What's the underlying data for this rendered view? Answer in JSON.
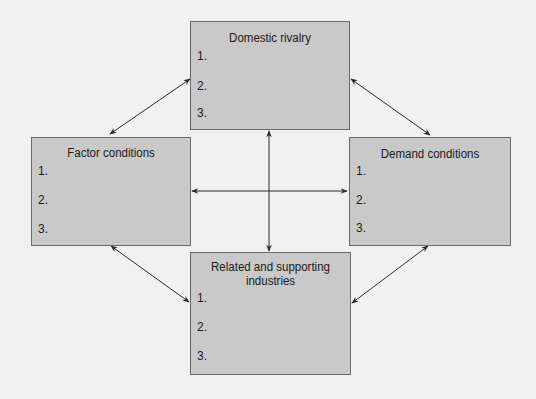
{
  "diagram": {
    "colors": {
      "background": "#f1f1f1",
      "box_fill": "#c9c9c9",
      "box_border": "#6b6b6b",
      "arrow": "#2a2a2a",
      "text": "#1a1a1a"
    },
    "boxes": {
      "domestic_rivalry": {
        "title": "Domestic rivalry",
        "items": [
          "1.",
          "2.",
          "3."
        ]
      },
      "factor_conditions": {
        "title": "Factor conditions",
        "items": [
          "1.",
          "2.",
          "3."
        ]
      },
      "demand_conditions": {
        "title": "Demand conditions",
        "items": [
          "1.",
          "2.",
          "3."
        ]
      },
      "related_supporting": {
        "title_line1": "Related and supporting",
        "title_line2": "industries",
        "items": [
          "1.",
          "2.",
          "3."
        ]
      }
    },
    "connections": [
      {
        "from": "domestic_rivalry",
        "to": "factor_conditions",
        "bidirectional": true
      },
      {
        "from": "domestic_rivalry",
        "to": "demand_conditions",
        "bidirectional": true
      },
      {
        "from": "domestic_rivalry",
        "to": "related_supporting",
        "bidirectional": true
      },
      {
        "from": "factor_conditions",
        "to": "demand_conditions",
        "bidirectional": true
      },
      {
        "from": "factor_conditions",
        "to": "related_supporting",
        "bidirectional": true
      },
      {
        "from": "demand_conditions",
        "to": "related_supporting",
        "bidirectional": true
      }
    ]
  }
}
